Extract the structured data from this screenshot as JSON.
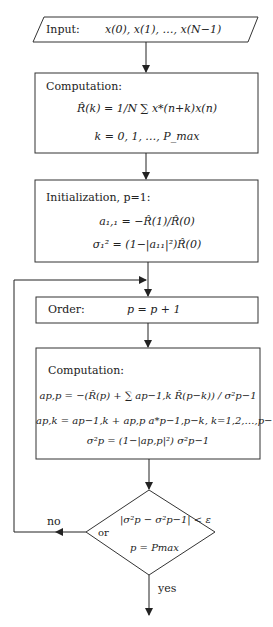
{
  "input": {
    "label": "Input:",
    "expr": "x(0), x(1), …, x(N−1)"
  },
  "computation1": {
    "label": "Computation:",
    "formula": "R̂(k) = (1/N) Σ_{n=0}^{N−k−1} x*(n+k) x(n)",
    "formula_display": "R̂(k) = 1/N ∑ x*(n+k)x(n)",
    "range": "k = 0, 1, …, P_max"
  },
  "initialization": {
    "label": "Initialization, p=1:",
    "eq1": "a₁,₁ = −R̂(1)/R̂(0)",
    "eq2": "σ₁² = (1−|a₁₁|²)R̂(0)"
  },
  "order": {
    "label": "Order:",
    "expr": "p = p + 1"
  },
  "computation2": {
    "label": "Computation:",
    "eq1": "a_{p,p} = −(R̂(p) + Σ_{k=1}^{p−1} a_{p−1,k} R̂(p−k)) / σ²_{p−1}",
    "eq1_display": "ap,p = −(R̂(p) + ∑ ap−1,k R̂(p−k)) / σ²p−1",
    "eq2": "ap,k = ap−1,k + ap,p a*p−1,p−k,  k=1,2,…,p−1",
    "eq3": "σ²p = (1−|ap,p|²) σ²p−1"
  },
  "decision": {
    "cond1": "|σ²p − σ²p−1| < ε",
    "or": "or",
    "cond2": "p = Pmax",
    "no": "no",
    "yes": "yes"
  }
}
